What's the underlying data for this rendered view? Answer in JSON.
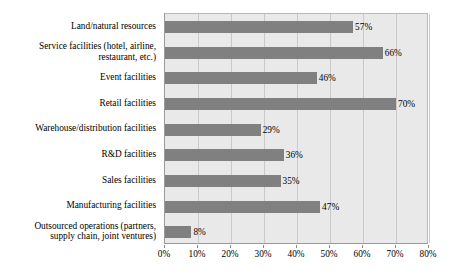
{
  "chart_data": {
    "type": "bar",
    "orientation": "horizontal",
    "title": "",
    "subtitle": "",
    "xlabel": "",
    "ylabel": "",
    "xlim": [
      0,
      80
    ],
    "grid": true,
    "legend": null,
    "value_suffix": "%",
    "categories": [
      "Land/natural resources",
      "Service facilities (hotel, airline, restaurant, etc.)",
      "Event facilities",
      "Retail facilities",
      "Warehouse/distribution facilities",
      "R&D facilities",
      "Sales facilities",
      "Manufacturing facilities",
      "Outsourced operations (partners, supply chain, joint ventures)"
    ],
    "category_lines": [
      [
        "Land/natural resources"
      ],
      [
        "Service facilities (hotel, airline,",
        "restaurant, etc.)"
      ],
      [
        "Event facilities"
      ],
      [
        "Retail facilities"
      ],
      [
        "Warehouse/distribution facilities"
      ],
      [
        "R&D facilities"
      ],
      [
        "Sales facilities"
      ],
      [
        "Manufacturing facilities"
      ],
      [
        "Outsourced operations (partners,",
        "supply chain, joint ventures)"
      ]
    ],
    "values": [
      57,
      66,
      46,
      70,
      29,
      36,
      35,
      47,
      8
    ],
    "data_labels": [
      "57%",
      "66%",
      "46%",
      "70%",
      "29%",
      "36%",
      "35%",
      "47%",
      "8%"
    ],
    "xticks": [
      0,
      10,
      20,
      30,
      40,
      50,
      60,
      70,
      80
    ],
    "xtick_labels": [
      "0%",
      "10%",
      "20%",
      "30%",
      "40%",
      "50%",
      "60%",
      "70%",
      "80%"
    ],
    "colors": {
      "bar": "#808080",
      "plot_background": "#e9e9e9",
      "gridline": "#c9c9c9",
      "axis_border": "#9a9a9a",
      "text": "#000000",
      "page_background": "#ffffff"
    }
  }
}
